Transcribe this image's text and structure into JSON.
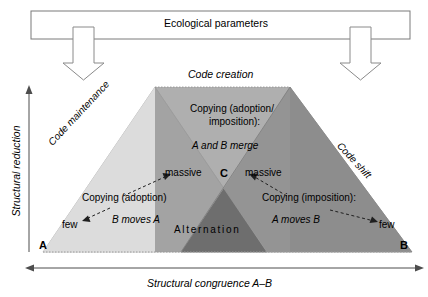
{
  "figure": {
    "top_box": {
      "label": "Ecological parameters"
    },
    "title": "Code creation",
    "axes": {
      "y_label": "Structural reduction",
      "x_label": "Structural congruence A–B"
    },
    "side_labels": {
      "left": "Code maintenance",
      "right": "Code shift"
    },
    "vertices": {
      "a": "A",
      "b": "B",
      "c": "C"
    },
    "center_block": {
      "line1": "Copying (adoption/",
      "line2": "imposition):",
      "line3": "A and B merge"
    },
    "left_block": {
      "massive": "massive",
      "title": "Copying (adoption)",
      "detail": "B moves A",
      "few": "few"
    },
    "right_block": {
      "massive": "massive",
      "title": "Copying (imposition):",
      "detail": "A moves B",
      "few": "few"
    },
    "overlap_label": "Alternation",
    "colors": {
      "light_gray": "#dcdcdc",
      "mid_gray": "#a8a8a8",
      "dark_gray": "#8d8d8d",
      "darkest_gray": "#6e6e6e",
      "outline": "#6b6b6b",
      "axis": "#4d4d4d"
    }
  }
}
